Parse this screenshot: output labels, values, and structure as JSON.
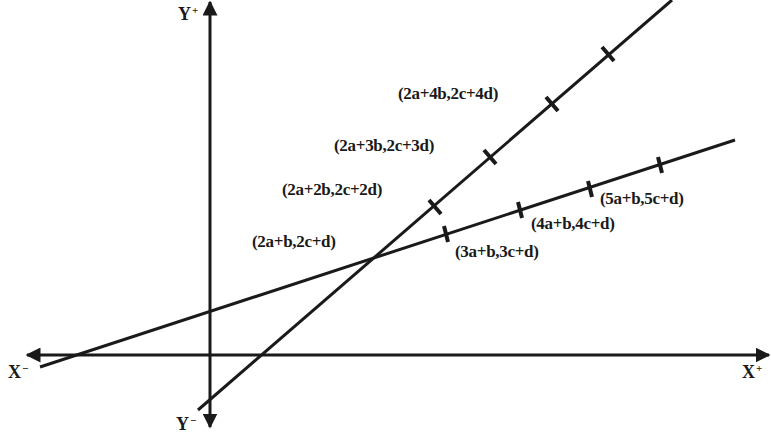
{
  "diagram": {
    "colors": {
      "ink": "#1a1a1a",
      "background": "#ffffff"
    },
    "axes": {
      "x_pos": {
        "letter": "X",
        "sign": "+"
      },
      "x_neg": {
        "letter": "X",
        "sign": "−"
      },
      "y_pos": {
        "letter": "Y",
        "sign": "+"
      },
      "y_neg": {
        "letter": "Y",
        "sign": "−"
      }
    },
    "intersection_label": "(2a+b,2c+d)",
    "steep_line": {
      "description": "line through (2a+b,2c+d) with step (b,d)",
      "points": [
        "(2a+2b,2c+2d)",
        "(2a+3b,2c+3d)",
        "(2a+4b,2c+4d)"
      ]
    },
    "shallow_line": {
      "description": "line through (2a+b,2c+d) with step (a,c)",
      "points": [
        "(3a+b,3c+d)",
        "(4a+b,4c+d)",
        "(5a+b,5c+d)"
      ]
    }
  }
}
